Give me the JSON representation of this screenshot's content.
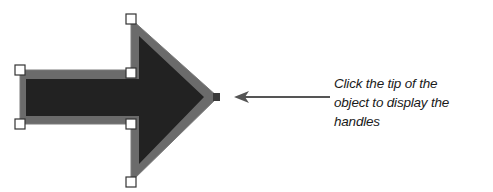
{
  "diagram": {
    "shape": "right-arrow",
    "fill_color": "#222222",
    "border_color": "#6b6b6b",
    "handle_count": 6,
    "caption_lines": [
      "Click the tip of the",
      "object to display the",
      "handles"
    ],
    "pointer_color": "#555555"
  }
}
